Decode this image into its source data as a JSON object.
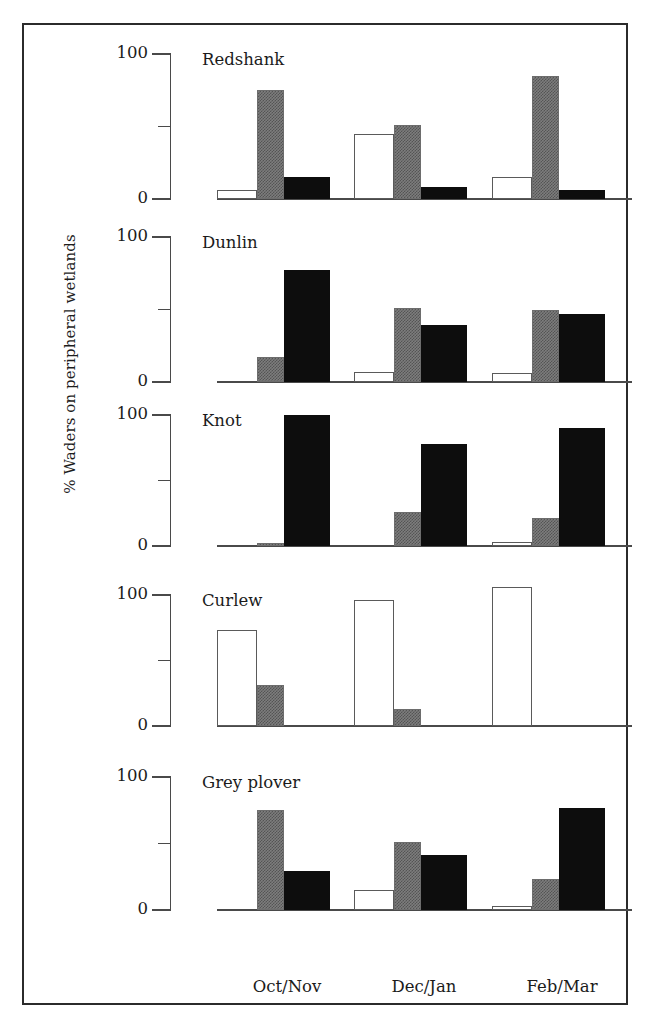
{
  "figure": {
    "y_axis_title": "% Waders on peripheral wetlands",
    "tick_labels": {
      "top": "100",
      "bottom": "0"
    },
    "categories": [
      "Oct/Nov",
      "Dec/Jan",
      "Feb/Mar"
    ],
    "series_names": [
      "white",
      "gray",
      "black"
    ],
    "colors": {
      "white_bar": "#ffffff",
      "gray_bar": "#7d7d7d",
      "black_bar": "#0d0d0d",
      "axis": "#4a4a4a",
      "frame": "#2b2b2b",
      "text": "#1b1b1b"
    },
    "panel_titles": [
      "Redshank",
      "Dunlin",
      "Knot",
      "Curlew",
      "Grey plover"
    ]
  },
  "chart_data": [
    {
      "type": "bar",
      "title": "Redshank",
      "xlabel": "",
      "ylabel": "% Waders on peripheral wetlands",
      "ylim": [
        0,
        100
      ],
      "yticks": [
        0,
        50,
        100
      ],
      "ytick_labels": [
        "0",
        "",
        "100"
      ],
      "grid": false,
      "legend": "none",
      "categories": [
        "Oct/Nov",
        "Dec/Jan",
        "Feb/Mar"
      ],
      "series": [
        {
          "name": "white",
          "values": [
            6,
            45,
            15
          ]
        },
        {
          "name": "gray",
          "values": [
            75,
            51,
            85
          ]
        },
        {
          "name": "black",
          "values": [
            15,
            8,
            6
          ]
        }
      ]
    },
    {
      "type": "bar",
      "title": "Dunlin",
      "xlabel": "",
      "ylabel": "% Waders on peripheral wetlands",
      "ylim": [
        0,
        100
      ],
      "yticks": [
        0,
        50,
        100
      ],
      "ytick_labels": [
        "0",
        "",
        "100"
      ],
      "grid": false,
      "legend": "none",
      "categories": [
        "Oct/Nov",
        "Dec/Jan",
        "Feb/Mar"
      ],
      "series": [
        {
          "name": "white",
          "values": [
            0,
            7,
            6
          ]
        },
        {
          "name": "gray",
          "values": [
            17,
            51,
            50
          ]
        },
        {
          "name": "black",
          "values": [
            77,
            39,
            47
          ]
        }
      ]
    },
    {
      "type": "bar",
      "title": "Knot",
      "xlabel": "",
      "ylabel": "% Waders on peripheral wetlands",
      "ylim": [
        0,
        100
      ],
      "yticks": [
        0,
        50,
        100
      ],
      "ytick_labels": [
        "0",
        "",
        "100"
      ],
      "grid": false,
      "legend": "none",
      "categories": [
        "Oct/Nov",
        "Dec/Jan",
        "Feb/Mar"
      ],
      "series": [
        {
          "name": "white",
          "values": [
            0,
            0,
            3
          ]
        },
        {
          "name": "gray",
          "values": [
            2,
            26,
            21
          ]
        },
        {
          "name": "black",
          "values": [
            100,
            78,
            90
          ]
        }
      ]
    },
    {
      "type": "bar",
      "title": "Curlew",
      "xlabel": "",
      "ylabel": "% Waders on peripheral wetlands",
      "ylim": [
        0,
        100
      ],
      "yticks": [
        0,
        50,
        100
      ],
      "ytick_labels": [
        "0",
        "",
        "100"
      ],
      "grid": false,
      "legend": "none",
      "categories": [
        "Oct/Nov",
        "Dec/Jan",
        "Feb/Mar"
      ],
      "series": [
        {
          "name": "white",
          "values": [
            73,
            96,
            106
          ]
        },
        {
          "name": "gray",
          "values": [
            31,
            13,
            0
          ]
        },
        {
          "name": "black",
          "values": [
            0,
            0,
            0
          ]
        }
      ]
    },
    {
      "type": "bar",
      "title": "Grey plover",
      "xlabel": "",
      "ylabel": "% Waders on peripheral wetlands",
      "ylim": [
        0,
        100
      ],
      "yticks": [
        0,
        50,
        100
      ],
      "ytick_labels": [
        "0",
        "",
        "100"
      ],
      "grid": false,
      "legend": "none",
      "categories": [
        "Oct/Nov",
        "Dec/Jan",
        "Feb/Mar"
      ],
      "series": [
        {
          "name": "white",
          "values": [
            0,
            15,
            3
          ]
        },
        {
          "name": "gray",
          "values": [
            75,
            51,
            23
          ]
        },
        {
          "name": "black",
          "values": [
            29,
            41,
            77
          ]
        }
      ]
    }
  ]
}
